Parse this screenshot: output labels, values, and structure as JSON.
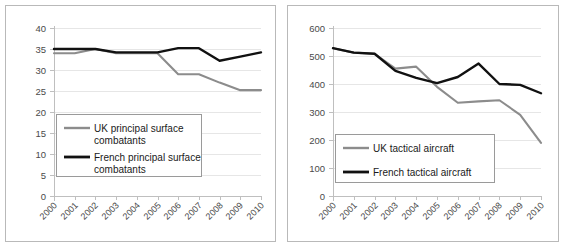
{
  "figure": {
    "background": "#ffffff",
    "panel_border_color": "#b9b9b9"
  },
  "colors": {
    "uk_line": "#8c8c8c",
    "french_line": "#111111",
    "gridline": "#e6e6e6",
    "axis": "#bfbfbf",
    "tick_text": "#4a4a4a",
    "legend_text": "#1a1a1a"
  },
  "chart_data": [
    {
      "id": "left",
      "type": "line",
      "title": "",
      "xlabel": "",
      "ylabel": "",
      "x": [
        "2000",
        "2001",
        "2002",
        "2003",
        "2004",
        "2005",
        "2006",
        "2007",
        "2008",
        "2009",
        "2010"
      ],
      "xticklabels": [
        "2000",
        "2001",
        "2002",
        "2003",
        "2004",
        "2005",
        "2006",
        "2007",
        "2008",
        "2009",
        "2010"
      ],
      "yticklabels": [
        "0",
        "5",
        "10",
        "15",
        "20",
        "25",
        "30",
        "35",
        "40"
      ],
      "yticks": [
        0,
        5,
        10,
        15,
        20,
        25,
        30,
        35,
        40
      ],
      "ylim": [
        0,
        40
      ],
      "grid": true,
      "legend_position": "lower-left",
      "series": [
        {
          "name": "UK principal surface combatants",
          "color": "#8c8c8c",
          "values": [
            34,
            34,
            35,
            34,
            34,
            34,
            29,
            29,
            27,
            25.2,
            25.2
          ]
        },
        {
          "name": "French principal surface combatants",
          "color": "#111111",
          "values": [
            35,
            35,
            35,
            34.2,
            34.2,
            34.2,
            35.2,
            35.2,
            32.2,
            33.2,
            34.2
          ]
        }
      ]
    },
    {
      "id": "right",
      "type": "line",
      "title": "",
      "xlabel": "",
      "ylabel": "",
      "x": [
        "2000",
        "2001",
        "2002",
        "2003",
        "2004",
        "2005",
        "2006",
        "2007",
        "2008",
        "2009",
        "2010"
      ],
      "xticklabels": [
        "2000",
        "2001",
        "2002",
        "2003",
        "2004",
        "2005",
        "2006",
        "2007",
        "2008",
        "2009",
        "2010"
      ],
      "yticklabels": [
        "0",
        "100",
        "200",
        "300",
        "400",
        "500",
        "600"
      ],
      "yticks": [
        0,
        100,
        200,
        300,
        400,
        500,
        600
      ],
      "ylim": [
        0,
        600
      ],
      "grid": true,
      "legend_position": "lower-left",
      "series": [
        {
          "name": "UK tactical aircraft",
          "color": "#8c8c8c",
          "values": [
            528,
            512,
            508,
            455,
            462,
            390,
            333,
            338,
            342,
            290,
            190
          ]
        },
        {
          "name": "French tactical aircraft",
          "color": "#111111",
          "values": [
            528,
            512,
            508,
            447,
            422,
            403,
            425,
            473,
            400,
            397,
            367
          ]
        }
      ]
    }
  ]
}
